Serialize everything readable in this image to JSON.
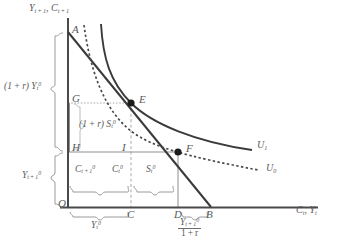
{
  "figure": {
    "type": "two-period-consumption-budget-diagram",
    "background_color": "#ffffff",
    "line_color": "#3a3a3a",
    "label_color": "#5a5a5a",
    "guide_color": "#9a9a9a"
  },
  "axes": {
    "y_axis_label_html": "Y<sub>t&#8201;+&#8201;1</sub>, C<sub>t&#8201;+&#8201;1</sub>",
    "x_axis_label_html": "C<sub>t</sub>, Y<sub>t</sub>",
    "origin_label": "O"
  },
  "points": [
    {
      "id": "A",
      "label": "A",
      "desc": "budget-line-vertical-intercept"
    },
    {
      "id": "E",
      "label": "E",
      "desc": "tangency-point-on-U1"
    },
    {
      "id": "F",
      "label": "F",
      "desc": "tangency-point-on-U0"
    },
    {
      "id": "G",
      "label": "G",
      "desc": "y-axis-point-level-with-E"
    },
    {
      "id": "H",
      "label": "H",
      "desc": "y-axis-point-level-with-F"
    },
    {
      "id": "I",
      "label": "I",
      "desc": "corner-point-below-E-right-of-H"
    },
    {
      "id": "C",
      "label": "C",
      "desc": "x-axis-point-below-E"
    },
    {
      "id": "D",
      "label": "D",
      "desc": "x-axis-point-below-F"
    },
    {
      "id": "B",
      "label": "B",
      "desc": "budget-line-horizontal-intercept"
    }
  ],
  "curves": [
    {
      "id": "U1",
      "label_html": "U<sub>1</sub>",
      "style": "solid",
      "desc": "higher-indifference-curve"
    },
    {
      "id": "U0",
      "label_html": "U<sub>0</sub>",
      "style": "dotted",
      "desc": "lower-indifference-curve"
    }
  ],
  "brace_labels": {
    "left_upper_html": "(1&#8201;+&#8201;r) Y<sub>t</sub><sup>0</sup>",
    "left_lower_html": "Y<sub>t&#8201;+&#8201;1</sub><sup>0</sup>",
    "inner_vertical_html": "(1&#8201;+&#8201;r) S<sub>t</sub><sup>0</sup>",
    "bottom_left_html": "C<sub>t&#8201;+&#8201;1</sub><sup>0</sup>",
    "bottom_mid_html": "C<sub>t</sub><sup>0</sup>",
    "bottom_right_html": "S<sub>t</sub><sup>0</sup>",
    "under_axis_left_html": "Y<sub>t</sub><sup>0</sup>",
    "under_axis_right_numerator_html": "Y<sub>t&#8201;+&#8201;1</sub><sup>0</sup>",
    "under_axis_right_denominator_html": "1&#8201;+&#8201;r"
  },
  "chart_data": {
    "type": "line",
    "title": "",
    "xlabel": "C_t, Y_t",
    "ylabel": "Y_{t+1}, C_{t+1}",
    "geometry": {
      "origin_px": [
        68,
        207
      ],
      "A_px": [
        68,
        32
      ],
      "B_px": [
        211,
        207
      ],
      "E_px": [
        131,
        103
      ],
      "F_px": [
        178,
        152
      ],
      "G_px": [
        68,
        103
      ],
      "H_px": [
        68,
        152
      ],
      "I_px": [
        131,
        152
      ],
      "C_px": [
        131,
        207
      ],
      "D_px": [
        178,
        207
      ]
    },
    "series": [
      {
        "name": "budget_line",
        "style": "solid",
        "from": "A",
        "to": "B"
      },
      {
        "name": "U1",
        "style": "solid",
        "tangent_at": "E"
      },
      {
        "name": "U0",
        "style": "dotted",
        "tangent_at": "F"
      }
    ]
  }
}
